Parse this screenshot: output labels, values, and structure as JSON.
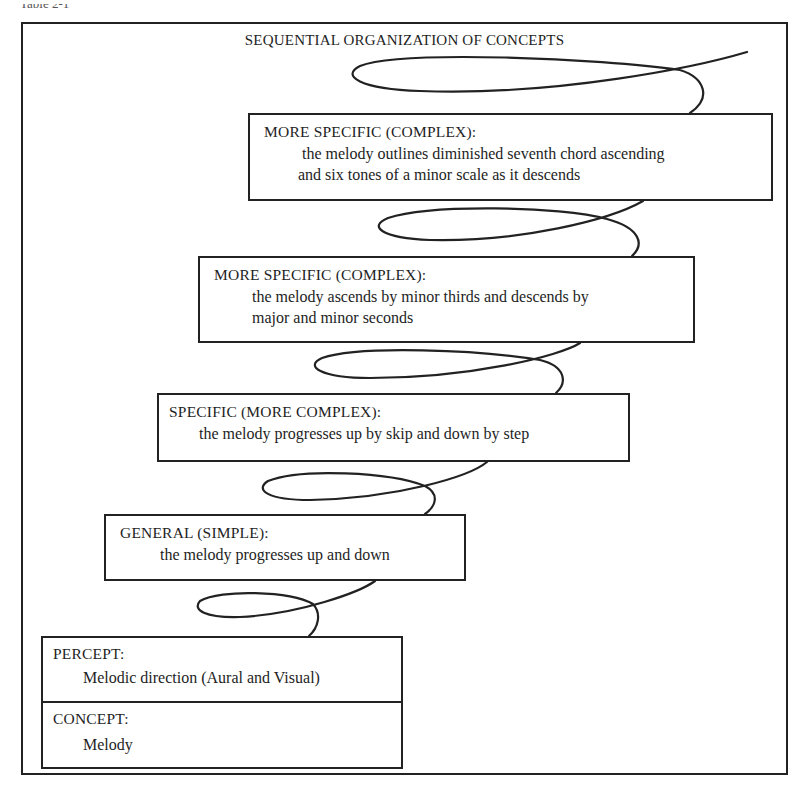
{
  "header_fragment": "Table 2-1",
  "diagram": {
    "title": "SEQUENTIAL ORGANIZATION OF CONCEPTS",
    "levels": [
      {
        "id": "more-specific-2",
        "heading": "MORE SPECIFIC (COMPLEX):",
        "lines": [
          "the melody outlines diminished seventh chord ascending",
          "and six tones of a minor scale as it descends"
        ]
      },
      {
        "id": "more-specific-1",
        "heading": "MORE SPECIFIC (COMPLEX):",
        "lines": [
          "the melody ascends by minor thirds and descends by",
          "major and minor seconds"
        ]
      },
      {
        "id": "specific",
        "heading": "SPECIFIC (MORE COMPLEX):",
        "lines": [
          "the melody progresses up by skip and down by step"
        ]
      },
      {
        "id": "general",
        "heading": "GENERAL (SIMPLE):",
        "lines": [
          "the melody progresses up and down"
        ]
      }
    ],
    "base": {
      "percept": {
        "heading": "PERCEPT:",
        "text": "Melodic direction (Aural and Visual)"
      },
      "concept": {
        "heading": "CONCEPT:",
        "text": "Melody"
      }
    },
    "colors": {
      "ink": "#222222",
      "background": "#ffffff"
    }
  }
}
